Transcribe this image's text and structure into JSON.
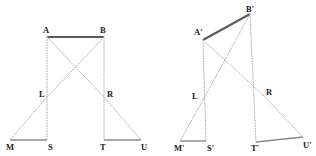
{
  "figure": {
    "canvas": {
      "width": 316,
      "height": 156
    },
    "colors": {
      "background": "#ffffff",
      "solid_line": "#5a5a5a",
      "dotted_line": "#b0b0b0",
      "baseline": "#8a8a8a",
      "label_text": "#1a1a1a"
    },
    "panels": [
      {
        "name": "left-panel",
        "id": "panel-left",
        "description": "Upright symmetric configuration",
        "points": {
          "A": {
            "label": "A",
            "x": 47,
            "y": 37,
            "label_x": 43,
            "label_y": 26
          },
          "B": {
            "label": "B",
            "x": 104,
            "y": 37,
            "label_x": 100,
            "label_y": 26
          },
          "L": {
            "label": "L",
            "x": 47,
            "y": 97,
            "label_x": 39,
            "label_y": 90
          },
          "R": {
            "label": "R",
            "x": 104,
            "y": 97,
            "label_x": 107,
            "label_y": 90
          },
          "M": {
            "label": "M",
            "x": 10,
            "y": 140,
            "label_x": 6,
            "label_y": 143
          },
          "S": {
            "label": "S",
            "x": 47,
            "y": 140,
            "label_x": 48,
            "label_y": 143
          },
          "T": {
            "label": "T",
            "x": 104,
            "y": 140,
            "label_x": 100,
            "label_y": 143
          },
          "U": {
            "label": "U",
            "x": 141,
            "y": 140,
            "label_x": 141,
            "label_y": 143
          }
        },
        "segments": [
          {
            "name": "top-bar-AB",
            "from": "A",
            "to": "B",
            "style": "solid",
            "weight": 2.0
          },
          {
            "name": "baseline-MS",
            "from": "M",
            "to": "S",
            "style": "solid",
            "weight": 1.4
          },
          {
            "name": "baseline-TU",
            "from": "T",
            "to": "U",
            "style": "solid",
            "weight": 1.4
          },
          {
            "name": "vertical-A-S",
            "from": "A",
            "to": "S",
            "style": "dotted",
            "weight": 1.0
          },
          {
            "name": "vertical-B-T",
            "from": "B",
            "to": "T",
            "style": "dotted",
            "weight": 1.0
          },
          {
            "name": "diagonal-A-R",
            "from": "A",
            "to": "R",
            "style": "dotted",
            "weight": 1.0
          },
          {
            "name": "diagonal-B-L",
            "from": "B",
            "to": "L",
            "style": "dotted",
            "weight": 1.0
          },
          {
            "name": "diagonal-L-M",
            "from": "L",
            "to": "M",
            "style": "dotted",
            "weight": 1.0
          },
          {
            "name": "diagonal-R-U",
            "from": "R",
            "to": "U",
            "style": "dotted",
            "weight": 1.0
          }
        ]
      },
      {
        "name": "right-panel",
        "id": "panel-right",
        "description": "Tilted / sheared configuration with primed labels",
        "points": {
          "A": {
            "label": "A'",
            "x": 203,
            "y": 40,
            "label_x": 194,
            "label_y": 28
          },
          "B": {
            "label": "B'",
            "x": 250,
            "y": 14,
            "label_x": 246,
            "label_y": 5
          },
          "L": {
            "label": "L",
            "x": 203,
            "y": 100,
            "label_x": 192,
            "label_y": 92
          },
          "R": {
            "label": "R",
            "x": 263,
            "y": 95,
            "label_x": 266,
            "label_y": 88
          },
          "M": {
            "label": "M'",
            "x": 180,
            "y": 141,
            "label_x": 174,
            "label_y": 144
          },
          "S": {
            "label": "S'",
            "x": 206,
            "y": 141,
            "label_x": 207,
            "label_y": 144
          },
          "T": {
            "label": "T'",
            "x": 256,
            "y": 142,
            "label_x": 251,
            "label_y": 144
          },
          "U": {
            "label": "U'",
            "x": 303,
            "y": 137,
            "label_x": 303,
            "label_y": 141
          }
        },
        "segments": [
          {
            "name": "top-bar-AB",
            "from": "A",
            "to": "B",
            "style": "solid",
            "weight": 2.0
          },
          {
            "name": "baseline-MS",
            "from": "M",
            "to": "S",
            "style": "solid",
            "weight": 1.4
          },
          {
            "name": "baseline-TU",
            "from": "T",
            "to": "U",
            "style": "solid",
            "weight": 1.4
          },
          {
            "name": "vertical-A-S",
            "from": "A",
            "to": "S",
            "style": "dotted",
            "weight": 1.0
          },
          {
            "name": "vertical-B-T",
            "from": "B",
            "to": "T",
            "style": "dotted",
            "weight": 1.0
          },
          {
            "name": "diagonal-A-R",
            "from": "A",
            "to": "R",
            "style": "dotted",
            "weight": 1.0
          },
          {
            "name": "diagonal-B-L",
            "from": "B",
            "to": "L",
            "style": "dotted",
            "weight": 1.0
          },
          {
            "name": "diagonal-L-M",
            "from": "L",
            "to": "M",
            "style": "dotted",
            "weight": 1.0
          },
          {
            "name": "diagonal-R-U",
            "from": "R",
            "to": "U",
            "style": "dotted",
            "weight": 1.0
          }
        ]
      }
    ]
  }
}
